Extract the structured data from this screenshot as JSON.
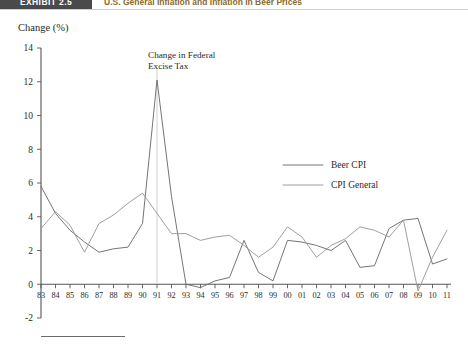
{
  "header": {
    "exhibit_tag": "EXHIBIT 2.5",
    "title": "U.S. General Inflation and Inflation in Beer Prices",
    "tag_bg": "#4a4a4a",
    "title_color": "#8a6a2f"
  },
  "chart_data": {
    "type": "line",
    "title": "U.S. General Inflation and Inflation in Beer Prices",
    "xlabel": "",
    "ylabel": "Change (%)",
    "ylim": [
      -2,
      14
    ],
    "xlim": [
      1983,
      2011
    ],
    "grid": false,
    "legend_position": "center-right",
    "y_ticks": [
      "14",
      "12",
      "10",
      "8",
      "6",
      "4",
      "2",
      "0",
      "-2"
    ],
    "y_tick_values": [
      14,
      12,
      10,
      8,
      6,
      4,
      2,
      0,
      -2
    ],
    "categories": [
      "83",
      "84",
      "85",
      "86",
      "87",
      "88",
      "89",
      "90",
      "91",
      "92",
      "93",
      "94",
      "95",
      "96",
      "97",
      "98",
      "99",
      "00",
      "01",
      "02",
      "03",
      "04",
      "05",
      "06",
      "07",
      "08",
      "09",
      "10",
      "11"
    ],
    "x_values": [
      1983,
      1984,
      1985,
      1986,
      1987,
      1988,
      1989,
      1990,
      1991,
      1992,
      1993,
      1994,
      1995,
      1996,
      1997,
      1998,
      1999,
      2000,
      2001,
      2002,
      2003,
      2004,
      2005,
      2006,
      2007,
      2008,
      2009,
      2010,
      2011
    ],
    "series": [
      {
        "name": "Beer CPI",
        "color": "#6e6e6e",
        "values": [
          5.8,
          4.2,
          3.2,
          2.5,
          1.9,
          2.1,
          2.2,
          3.6,
          12.1,
          5.2,
          0.0,
          -0.2,
          0.2,
          0.4,
          2.6,
          0.7,
          0.2,
          2.6,
          2.5,
          2.3,
          2.0,
          2.6,
          1.0,
          1.1,
          3.3,
          3.8,
          3.9,
          1.2,
          1.5
        ]
      },
      {
        "name": "CPI General",
        "color": "#9a9a9a",
        "values": [
          3.3,
          4.3,
          3.5,
          1.9,
          3.6,
          4.1,
          4.8,
          5.4,
          4.2,
          3.0,
          3.0,
          2.6,
          2.8,
          2.9,
          2.3,
          1.6,
          2.2,
          3.4,
          2.8,
          1.6,
          2.3,
          2.7,
          3.4,
          3.2,
          2.8,
          3.8,
          -0.4,
          1.6,
          3.2
        ]
      }
    ],
    "annotations": [
      {
        "name": "excise-tax-annotation",
        "line1": "Change in Federal",
        "line2": "Excise Tax",
        "points_to_year": 1991
      }
    ]
  }
}
